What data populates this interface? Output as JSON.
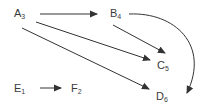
{
  "diagram": {
    "type": "directed-graph",
    "nodes": [
      {
        "id": "A",
        "label": "A",
        "sub": "3"
      },
      {
        "id": "B",
        "label": "B",
        "sub": "4"
      },
      {
        "id": "C",
        "label": "C",
        "sub": "5"
      },
      {
        "id": "D",
        "label": "D",
        "sub": "6"
      },
      {
        "id": "E",
        "label": "E",
        "sub": "1"
      },
      {
        "id": "F",
        "label": "F",
        "sub": "2"
      }
    ],
    "edges": [
      {
        "from": "A",
        "to": "B",
        "style": "straight"
      },
      {
        "from": "A",
        "to": "C",
        "style": "straight"
      },
      {
        "from": "A",
        "to": "D",
        "style": "straight"
      },
      {
        "from": "B",
        "to": "C",
        "style": "straight"
      },
      {
        "from": "B",
        "to": "D",
        "style": "curved"
      },
      {
        "from": "E",
        "to": "F",
        "style": "straight"
      }
    ],
    "colors": {
      "edge": "#333333",
      "text": "#3a3a3a",
      "background": "#ffffff"
    }
  }
}
